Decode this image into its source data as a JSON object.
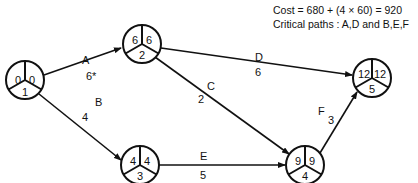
{
  "header": {
    "cost_line": "Cost = 680 + (4 × 60) = 920",
    "critical_line": "Critical  paths : A,D and B,E,F"
  },
  "nodes": [
    {
      "id": "1",
      "left": "0",
      "right": "0",
      "bottom": "1"
    },
    {
      "id": "2",
      "left": "6",
      "right": "6",
      "bottom": "2"
    },
    {
      "id": "3",
      "left": "4",
      "right": "4",
      "bottom": "3"
    },
    {
      "id": "4",
      "left": "9",
      "right": "9",
      "bottom": "4"
    },
    {
      "id": "5",
      "left": "12",
      "right": "12",
      "bottom": "5"
    }
  ],
  "activities": [
    {
      "name": "A",
      "duration": "6*",
      "from": "1",
      "to": "2"
    },
    {
      "name": "B",
      "duration": "4",
      "from": "1",
      "to": "3"
    },
    {
      "name": "C",
      "duration": "2",
      "from": "2",
      "to": "4"
    },
    {
      "name": "D",
      "duration": "6",
      "from": "2",
      "to": "5"
    },
    {
      "name": "E",
      "duration": "5",
      "from": "3",
      "to": "4"
    },
    {
      "name": "F",
      "duration": "3",
      "from": "4",
      "to": "5"
    }
  ]
}
